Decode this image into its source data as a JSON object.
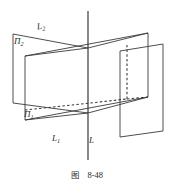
{
  "figure": {
    "caption_prefix": "图",
    "caption_number": "8-48",
    "labels": {
      "plane_upper": "Π",
      "plane_upper_sub": "2",
      "plane_lower": "Π",
      "plane_lower_sub": "1",
      "line_upper": "L",
      "line_upper_sub": "2",
      "line_lower": "L",
      "line_lower_sub": "1",
      "line_axis": "L"
    },
    "colors": {
      "stroke": "#3a3a3a",
      "background": "#ffffff",
      "text": "#2b2b2b"
    },
    "geometry": {
      "axis_line": {
        "x": 88,
        "y1": 11,
        "y2": 160
      },
      "upper_intersection": {
        "x": 88,
        "y": 48
      },
      "lower_intersection": {
        "x": 88,
        "y": 113
      },
      "plane_pi2_quad": [
        [
          13,
          34
        ],
        [
          88,
          48
        ],
        [
          88,
          103
        ],
        [
          13,
          103
        ]
      ],
      "plane_pi2_front_quad": [
        [
          25,
          56
        ],
        [
          88,
          48
        ],
        [
          88,
          113
        ],
        [
          25,
          120
        ]
      ],
      "band_top_edge": [
        [
          25,
          56
        ],
        [
          148,
          33
        ]
      ],
      "band_bottom_edge": [
        [
          25,
          120
        ],
        [
          148,
          97
        ]
      ],
      "right_plane_quad": [
        [
          120,
          51
        ],
        [
          163,
          44
        ],
        [
          163,
          131
        ],
        [
          120,
          137
        ]
      ],
      "hidden_edges": [
        [
          [
            25,
            110
          ],
          [
            127,
            99
          ]
        ],
        [
          [
            127,
            99
          ],
          [
            127,
            44
          ]
        ],
        [
          [
            127,
            99
          ],
          [
            148,
            97
          ]
        ]
      ],
      "left_vertical": {
        "x": 13,
        "y1": 34,
        "y2": 103
      },
      "right_vertical_top": {
        "x": 148,
        "y1": 33,
        "y2": 97
      }
    }
  }
}
